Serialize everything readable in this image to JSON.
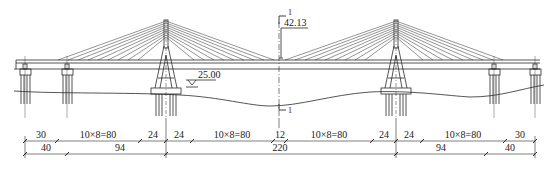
{
  "drawing": {
    "title": "Cable-stayed bridge elevation",
    "line_color": "#2a2a2a",
    "background": "#ffffff"
  },
  "annotations": {
    "elevation_center": "42.13",
    "water_level": "25.00",
    "section_mark_top": "1",
    "section_mark_bottom": "1"
  },
  "dimensions": {
    "row1": [
      {
        "label": "30",
        "x1": 25,
        "x2": 57
      },
      {
        "label": "10×8=80",
        "x1": 57,
        "x2": 140
      },
      {
        "label": "24",
        "x1": 140,
        "x2": 166
      },
      {
        "label": "24",
        "x1": 166,
        "x2": 192
      },
      {
        "label": "10×8=80",
        "x1": 192,
        "x2": 273
      },
      {
        "label": "12",
        "x1": 273,
        "x2": 286
      },
      {
        "label": "10×8=80",
        "x1": 286,
        "x2": 372
      },
      {
        "label": "24",
        "x1": 372,
        "x2": 396
      },
      {
        "label": "24",
        "x1": 396,
        "x2": 422
      },
      {
        "label": "10×8=80",
        "x1": 422,
        "x2": 505
      },
      {
        "label": "30",
        "x1": 505,
        "x2": 535
      }
    ],
    "row2": [
      {
        "label": "40",
        "x1": 25,
        "x2": 67
      },
      {
        "label": "94",
        "x1": 67,
        "x2": 166
      },
      {
        "label": "220",
        "x1": 166,
        "x2": 396
      },
      {
        "label": "94",
        "x1": 396,
        "x2": 486
      },
      {
        "label": "40",
        "x1": 486,
        "x2": 535
      }
    ]
  }
}
